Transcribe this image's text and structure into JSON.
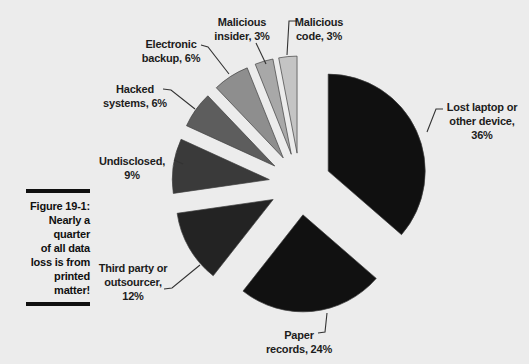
{
  "figure": {
    "label": "Figure 19-1:",
    "caption_lines": [
      "Nearly a",
      "quarter",
      "of all data",
      "loss is from",
      "printed",
      "matter!"
    ]
  },
  "chart_data": {
    "type": "pie",
    "title": "",
    "unit": "%",
    "categories": [
      "Lost laptop or other device",
      "Paper records",
      "Third party or outsourcer",
      "Undisclosed",
      "Hacked systems",
      "Electronic backup",
      "Malicious insider",
      "Malicious code"
    ],
    "values": [
      36,
      24,
      12,
      9,
      6,
      6,
      3,
      3
    ],
    "slices": [
      {
        "label": "Lost laptop or other device",
        "value": 36,
        "label_lines": [
          "Lost laptop or",
          "other device,",
          "36%"
        ],
        "color": "#101010"
      },
      {
        "label": "Paper records",
        "value": 24,
        "label_lines": [
          "Paper",
          "records, 24%"
        ],
        "color": "#111111"
      },
      {
        "label": "Third party or outsourcer",
        "value": 12,
        "label_lines": [
          "Third party or",
          "outsourcer,",
          "12%"
        ],
        "color": "#232323"
      },
      {
        "label": "Undisclosed",
        "value": 9,
        "label_lines": [
          "Undisclosed,",
          "9%"
        ],
        "color": "#3a3a3a"
      },
      {
        "label": "Hacked systems",
        "value": 6,
        "label_lines": [
          "Hacked",
          "systems, 6%"
        ],
        "color": "#5d5d5d"
      },
      {
        "label": "Electronic backup",
        "value": 6,
        "label_lines": [
          "Electronic",
          "backup, 6%"
        ],
        "color": "#8e8e8e"
      },
      {
        "label": "Malicious insider",
        "value": 3,
        "label_lines": [
          "Malicious",
          "insider, 3%"
        ],
        "color": "#a8a8a8"
      },
      {
        "label": "Malicious code",
        "value": 3,
        "label_lines": [
          "Malicious",
          "code, 3%"
        ],
        "color": "#c4c4c4"
      }
    ],
    "layout_hints": {
      "start_angle_deg": 0,
      "direction": "clockwise",
      "exploded": true,
      "labels": "outside-with-leader-lines",
      "legend": "none",
      "background": "#ececec",
      "leader_color": "#333333"
    }
  }
}
